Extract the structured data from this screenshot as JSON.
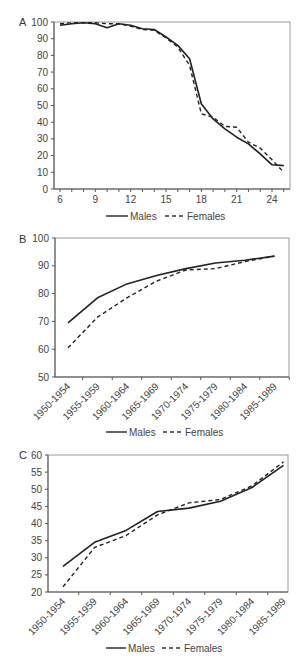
{
  "chart_data": [
    {
      "panel": "A",
      "type": "line",
      "xlabel": "",
      "ylabel": "",
      "xlim": [
        6,
        25
      ],
      "ylim": [
        0,
        100
      ],
      "x_ticks": [
        "6",
        "9",
        "12",
        "15",
        "18",
        "21",
        "24"
      ],
      "y_ticks": [
        "0",
        "10",
        "20",
        "30",
        "40",
        "50",
        "60",
        "70",
        "80",
        "90",
        "100"
      ],
      "x": [
        6,
        7,
        8,
        9,
        10,
        11,
        12,
        13,
        14,
        15,
        16,
        17,
        18,
        19,
        20,
        21,
        22,
        23,
        24,
        25
      ],
      "series": [
        {
          "name": "Males",
          "style": "solid",
          "values": [
            98,
            99,
            99.5,
            99,
            96.5,
            99,
            98,
            96,
            95.5,
            91,
            86,
            78,
            51,
            42,
            36,
            31,
            27,
            21,
            14.5,
            14
          ]
        },
        {
          "name": "Females",
          "style": "dashed",
          "values": [
            99,
            99.5,
            99.5,
            99.5,
            99,
            99,
            97.5,
            95.5,
            95,
            90.5,
            85,
            74,
            45,
            43,
            37.5,
            37,
            28,
            24.5,
            17.5,
            10
          ]
        }
      ],
      "legend": [
        "Males",
        "Females"
      ],
      "legend_position": "bottom",
      "grid": false
    },
    {
      "panel": "B",
      "type": "line",
      "xlabel": "",
      "ylabel": "",
      "ylim": [
        50,
        100
      ],
      "y_ticks": [
        "50",
        "60",
        "70",
        "80",
        "90",
        "100"
      ],
      "categories": [
        "1950-1954",
        "1955-1959",
        "1960-1964",
        "1965-1969",
        "1970-1974",
        "1975-1979",
        "1980-1984",
        "1985-1989"
      ],
      "series": [
        {
          "name": "Males",
          "style": "solid",
          "values": [
            69.5,
            78.5,
            83.5,
            86.5,
            89,
            91,
            92,
            93.5
          ]
        },
        {
          "name": "Females",
          "style": "dashed",
          "values": [
            60.5,
            71.5,
            78.5,
            84.5,
            88.5,
            89,
            91.5,
            93.5
          ]
        }
      ],
      "legend": [
        "Males",
        "Females"
      ],
      "legend_position": "bottom",
      "grid": false
    },
    {
      "panel": "C",
      "type": "line",
      "xlabel": "",
      "ylabel": "",
      "ylim": [
        20,
        60
      ],
      "y_ticks": [
        "20",
        "25",
        "30",
        "35",
        "40",
        "45",
        "50",
        "55",
        "60"
      ],
      "categories": [
        "1950-1954",
        "1955-1959",
        "1960-1964",
        "1965-1969",
        "1970-1974",
        "1975-1979",
        "1980-1984",
        "1985-1989"
      ],
      "series": [
        {
          "name": "Males",
          "style": "solid",
          "values": [
            27.5,
            34.5,
            38,
            43.5,
            44.5,
            46.5,
            50.5,
            57
          ]
        },
        {
          "name": "Females",
          "style": "dashed",
          "values": [
            21.5,
            33,
            36.5,
            42.5,
            46,
            47,
            51,
            58
          ]
        }
      ],
      "legend": [
        "Males",
        "Females"
      ],
      "legend_position": "bottom",
      "grid": false
    }
  ],
  "labels": {
    "panelA": "A",
    "panelB": "B",
    "panelC": "C",
    "males": "Males",
    "females": "Females"
  }
}
